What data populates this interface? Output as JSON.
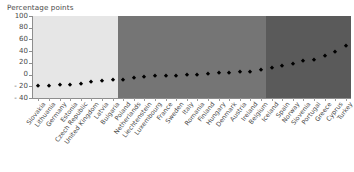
{
  "chart_data": {
    "type": "scatter",
    "title": "",
    "ylabel": "Percentage points",
    "xlabel": "",
    "ylim": [
      -40,
      100
    ],
    "yticks": [
      -40,
      -20,
      0,
      20,
      40,
      60,
      80,
      100
    ],
    "ytick_labels": [
      "- 40",
      "- 20",
      "0",
      "20",
      "40",
      "60",
      "80",
      "100"
    ],
    "grid": false,
    "legend": "none",
    "marker": "diamond",
    "marker_color": "#000000",
    "categories": [
      "Slovakia",
      "Lithuania",
      "Germany",
      "Estonia",
      "Czech Republic",
      "United Kingdom",
      "Latvia",
      "Bulgaria",
      "Poland",
      "Netherlands",
      "Liechtenstein",
      "Luxembourg",
      "France",
      "Sweden",
      "Italy",
      "Romania",
      "Finland",
      "Hungary",
      "Denmark",
      "Austria",
      "Ireland",
      "Belgium",
      "Iceland",
      "Spain",
      "Norway",
      "Slovenia",
      "Portugal",
      "Greece",
      "Cyprus",
      "Turkey"
    ],
    "values": [
      -20,
      -19,
      -18,
      -18,
      -16,
      -12,
      -11,
      -10,
      -9,
      -5,
      -4,
      -3,
      -3,
      -2,
      -1,
      0,
      1,
      2,
      3,
      4,
      5,
      7,
      12,
      14,
      18,
      24,
      25,
      31,
      38,
      48
    ],
    "bands": [
      {
        "name": "band-light",
        "start_index": 0,
        "end_index": 8,
        "color": "#e6e6e6"
      },
      {
        "name": "band-medium",
        "start_index": 8,
        "end_index": 22,
        "color": "#757575"
      },
      {
        "name": "band-dark",
        "start_index": 22,
        "end_index": 30,
        "color": "#5a5a5a"
      }
    ]
  },
  "colors": {
    "axis": "#8d8d8d",
    "text": "#4a4a4a",
    "marker": "#000000",
    "background": "#ffffff"
  }
}
